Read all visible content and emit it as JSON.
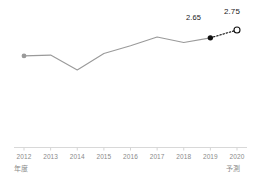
{
  "chart_data": {
    "type": "line",
    "title": "",
    "subtitle": "",
    "xlabel": "年度",
    "ylabel": "",
    "grid": false,
    "legend": "none",
    "categories": [
      "2012",
      "2013",
      "2014",
      "2015",
      "2016",
      "2017",
      "2018",
      "2019",
      "2020"
    ],
    "xlim": [
      2012,
      2020
    ],
    "ylim": [
      2.0,
      2.9
    ],
    "series": [
      {
        "name": "actual",
        "style": "solid",
        "color": "#9a9a9a",
        "values": [
          2.42,
          2.43,
          2.24,
          2.45,
          2.55,
          2.66,
          2.59,
          2.65,
          null
        ]
      },
      {
        "name": "forecast",
        "style": "dotted",
        "color": "#1a1a1a",
        "values": [
          null,
          null,
          null,
          null,
          null,
          null,
          null,
          2.65,
          2.75
        ]
      }
    ],
    "annotations": [
      {
        "name": "value-2019",
        "text": "2.65",
        "x": "2019",
        "value": 2.65
      },
      {
        "name": "value-2020",
        "text": "2.75",
        "x": "2020",
        "value": 2.75
      }
    ],
    "markers": [
      {
        "name": "start-point",
        "x": "2012",
        "shape": "filled-circle",
        "color": "#9a9a9a"
      },
      {
        "name": "latest-actual-point",
        "x": "2019",
        "shape": "filled-circle",
        "color": "#111111"
      },
      {
        "name": "forecast-point",
        "x": "2020",
        "shape": "open-circle",
        "color": "#111111"
      }
    ]
  },
  "axis": {
    "caption_left": "年度",
    "caption_forecast": "予測",
    "line_color": "#d5d5d5",
    "tick_labels": [
      "2012",
      "2013",
      "2014",
      "2015",
      "2016",
      "2017",
      "2018",
      "2019",
      "2020"
    ]
  },
  "colors": {
    "line": "#9a9a9a",
    "forecast": "#111111",
    "axis": "#d5d5d5",
    "tick_text": "#8a8a8a",
    "value_text": "#1a1a1a",
    "background": "#ffffff"
  }
}
